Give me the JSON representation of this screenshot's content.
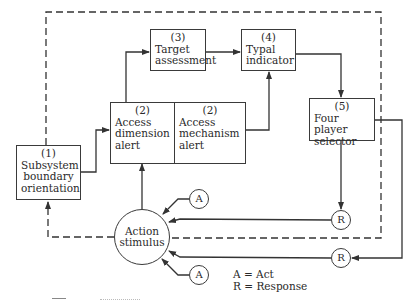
{
  "diagram": {
    "nodes": {
      "subsystem": {
        "number": "(1)",
        "lines": [
          "Subsystem",
          "boundary",
          "orientation"
        ]
      },
      "access_dimension": {
        "number": "(2)",
        "lines": [
          "Access",
          "dimension",
          "alert"
        ]
      },
      "access_mechanism": {
        "number": "(2)",
        "lines": [
          "Access",
          "mechanism",
          "alert"
        ]
      },
      "target": {
        "number": "(3)",
        "lines": [
          "Target",
          "assessment"
        ]
      },
      "typal": {
        "number": "(4)",
        "lines": [
          "Typal",
          "indicator"
        ]
      },
      "selector": {
        "number": "(5)",
        "lines": [
          "Four player",
          "selector"
        ]
      },
      "stimulus": {
        "lines": [
          "Action",
          "stimulus"
        ]
      }
    },
    "markers": {
      "a_top": "A",
      "a_bottom": "A",
      "r_top": "R",
      "r_bottom": "R"
    },
    "legend": {
      "a": "A = Act",
      "r": "R = Response"
    },
    "edges": [
      {
        "from": "subsystem",
        "to": "access_dimension",
        "style": "solid"
      },
      {
        "from": "access_dimension",
        "to": "target",
        "style": "solid"
      },
      {
        "from": "target",
        "to": "typal",
        "style": "solid"
      },
      {
        "from": "access_mechanism",
        "to": "typal",
        "style": "solid"
      },
      {
        "from": "typal",
        "to": "selector",
        "style": "solid"
      },
      {
        "from": "selector",
        "to": "r_top",
        "style": "solid"
      },
      {
        "from": "selector",
        "to": "r_bottom",
        "style": "solid"
      },
      {
        "from": "r_top",
        "to": "stimulus",
        "style": "solid"
      },
      {
        "from": "r_bottom",
        "to": "stimulus",
        "style": "solid"
      },
      {
        "from": "a_top",
        "to": "stimulus",
        "style": "solid"
      },
      {
        "from": "a_bottom",
        "to": "stimulus",
        "style": "solid"
      },
      {
        "from": "stimulus",
        "to": "access_dimension",
        "style": "solid"
      },
      {
        "from": "stimulus",
        "to": "subsystem",
        "style": "dashed"
      },
      {
        "from": "subsystem",
        "to": "subsystem",
        "style": "dashed",
        "note": "outer feedback boundary loop"
      }
    ]
  }
}
